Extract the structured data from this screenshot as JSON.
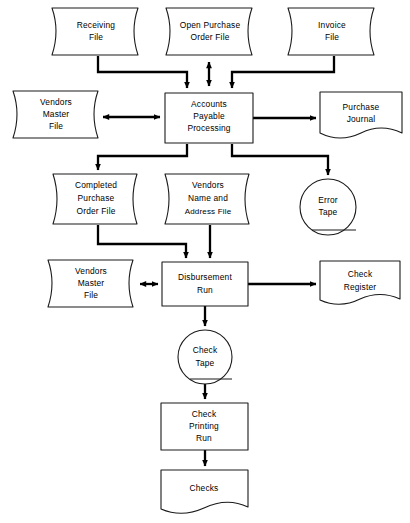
{
  "diagram": {
    "type": "system-flowchart",
    "background_color": "#ffffff",
    "line_color": "#000000",
    "shape_fill": "#ffffff",
    "shape_stroke": "#1a1a1a"
  },
  "nodes": {
    "receiving_file": {
      "label_lines": [
        "Receiving",
        "File"
      ],
      "line1": "Receiving",
      "line2": "File",
      "shape": "magnetic-tape-file",
      "x": 52,
      "y": 8,
      "w": 93,
      "h": 47
    },
    "open_purchase_order_file": {
      "label_lines": [
        "Open Purchase",
        "Order File"
      ],
      "line1": "Open Purchase",
      "line2": "Order File",
      "shape": "magnetic-tape-file",
      "x": 166,
      "y": 8,
      "w": 93,
      "h": 47
    },
    "invoice_file": {
      "label_lines": [
        "Invoice",
        "File"
      ],
      "line1": "Invoice",
      "line2": "File",
      "shape": "magnetic-tape-file",
      "x": 288,
      "y": 8,
      "w": 93,
      "h": 47
    },
    "vendors_master_file_top": {
      "label_lines": [
        "Vendors",
        "Master",
        "File"
      ],
      "line1": "Vendors",
      "line2": "Master",
      "line3": "File",
      "shape": "magnetic-tape-file",
      "x": 13,
      "y": 91,
      "w": 92,
      "h": 47
    },
    "accounts_payable_processing": {
      "label_lines": [
        "Accounts",
        "Payable",
        "Processing"
      ],
      "line1": "Accounts",
      "line2": "Payable",
      "line3": "Processing",
      "shape": "process-box",
      "x": 165,
      "y": 93,
      "w": 88,
      "h": 50
    },
    "purchase_journal": {
      "label_lines": [
        "Purchase",
        "Journal"
      ],
      "line1": "Purchase",
      "line2": "Journal",
      "shape": "document",
      "x": 320,
      "y": 92,
      "w": 82,
      "h": 50
    },
    "completed_purchase_order_file": {
      "label_lines": [
        "Completed",
        "Purchase",
        "Order File"
      ],
      "line1": "Completed",
      "line2": "Purchase",
      "line3": "Order File",
      "shape": "magnetic-tape-file",
      "x": 53,
      "y": 174,
      "w": 91,
      "h": 50
    },
    "vendors_name_address_file": {
      "label_lines": [
        "Vendors",
        "Name and",
        "Address File"
      ],
      "line1": "Vendors",
      "line2": "Name and",
      "line3": "Address File",
      "shape": "magnetic-tape-file",
      "x": 165,
      "y": 174,
      "w": 91,
      "h": 50
    },
    "error_tape": {
      "label_lines": [
        "Error",
        "Tape"
      ],
      "line1": "Error",
      "line2": "Tape",
      "shape": "tape-circle",
      "cx": 328,
      "cy": 207,
      "r": 28
    },
    "vendors_master_file_bottom": {
      "label_lines": [
        "Vendors",
        "Master",
        "File"
      ],
      "line1": "Vendors",
      "line2": "Master",
      "line3": "File",
      "shape": "magnetic-tape-file",
      "x": 48,
      "y": 260,
      "w": 92,
      "h": 47
    },
    "disbursement_run": {
      "label_lines": [
        "Disbursement",
        "Run"
      ],
      "line1": "Disbursement",
      "line2": "Run",
      "shape": "process-box",
      "x": 162,
      "y": 262,
      "w": 86,
      "h": 44
    },
    "check_register": {
      "label_lines": [
        "Check",
        "Register"
      ],
      "line1": "Check",
      "line2": "Register",
      "shape": "document",
      "x": 320,
      "y": 261,
      "w": 80,
      "h": 48
    },
    "check_tape": {
      "label_lines": [
        "Check",
        "Tape"
      ],
      "line1": "Check",
      "line2": "Tape",
      "shape": "tape-circle",
      "cx": 205,
      "cy": 357,
      "r": 27
    },
    "check_printing_run": {
      "label_lines": [
        "Check",
        "Printing",
        "Run"
      ],
      "line1": "Check",
      "line2": "Printing",
      "line3": "Run",
      "shape": "process-box",
      "x": 161,
      "y": 403,
      "w": 87,
      "h": 47
    },
    "checks": {
      "label_lines": [
        "Checks"
      ],
      "line1": "Checks",
      "shape": "document",
      "x": 161,
      "y": 470,
      "w": 87,
      "h": 48
    }
  },
  "connections": [
    {
      "id": "receiving-to-ap",
      "from": "receiving_file",
      "to": "accounts_payable_processing",
      "direction": "one-way"
    },
    {
      "id": "open-po-to-ap",
      "from": "open_purchase_order_file",
      "to": "accounts_payable_processing",
      "direction": "two-way"
    },
    {
      "id": "invoice-to-ap",
      "from": "invoice_file",
      "to": "accounts_payable_processing",
      "direction": "one-way"
    },
    {
      "id": "vendors-master-top-to-ap",
      "from": "vendors_master_file_top",
      "to": "accounts_payable_processing",
      "direction": "two-way"
    },
    {
      "id": "ap-to-purchase-journal",
      "from": "accounts_payable_processing",
      "to": "purchase_journal",
      "direction": "one-way"
    },
    {
      "id": "ap-to-completed-po",
      "from": "accounts_payable_processing",
      "to": "completed_purchase_order_file",
      "direction": "one-way"
    },
    {
      "id": "ap-to-error-tape",
      "from": "accounts_payable_processing",
      "to": "error_tape",
      "direction": "one-way"
    },
    {
      "id": "completed-po-to-disbursement",
      "from": "completed_purchase_order_file",
      "to": "disbursement_run",
      "direction": "one-way"
    },
    {
      "id": "vendors-name-to-disbursement",
      "from": "vendors_name_address_file",
      "to": "disbursement_run",
      "direction": "one-way"
    },
    {
      "id": "vendors-master-bottom-to-disbursement",
      "from": "vendors_master_file_bottom",
      "to": "disbursement_run",
      "direction": "two-way"
    },
    {
      "id": "disbursement-to-check-register",
      "from": "disbursement_run",
      "to": "check_register",
      "direction": "one-way"
    },
    {
      "id": "disbursement-to-check-tape",
      "from": "disbursement_run",
      "to": "check_tape",
      "direction": "one-way"
    },
    {
      "id": "check-tape-to-printing",
      "from": "check_tape",
      "to": "check_printing_run",
      "direction": "one-way"
    },
    {
      "id": "printing-to-checks",
      "from": "check_printing_run",
      "to": "checks",
      "direction": "one-way"
    }
  ]
}
